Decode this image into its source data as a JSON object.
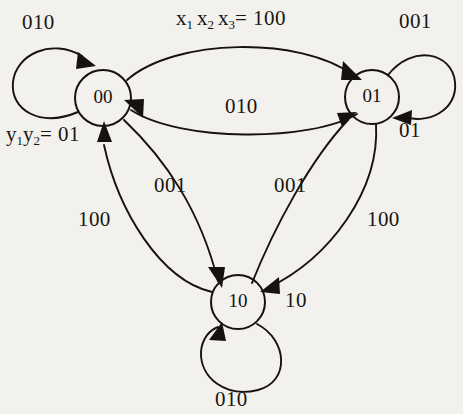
{
  "diagram": {
    "ink_color": "#15120f",
    "background_color": "#f2f1ee",
    "states": [
      {
        "id": "s00",
        "label": "00",
        "cx": 103,
        "cy": 98,
        "r": 28
      },
      {
        "id": "s01",
        "label": "01",
        "cx": 372,
        "cy": 97,
        "r": 27
      },
      {
        "id": "s10",
        "label": "10",
        "cx": 238,
        "cy": 302,
        "r": 27
      }
    ],
    "legend": {
      "input_vars_prefix": "x",
      "input_label_parts": {
        "x1": "x",
        "sub1": "1",
        "x2": "x",
        "sub2": "2",
        "x3": "x",
        "sub3": "3",
        "equals": "= 100"
      },
      "state_vars_parts": {
        "y1": "y",
        "sub1": "1",
        "y2": "y",
        "sub2": "2",
        "equals": "= 01"
      },
      "input_label_text": "x1 x2 x3 = 100",
      "state_label_text": "y1y2= 01"
    },
    "transitions": [
      {
        "id": "t-00-00",
        "from": "00",
        "to": "00",
        "input": "010",
        "kind": "self-loop-left"
      },
      {
        "id": "t-00-01",
        "from": "00",
        "to": "01",
        "input": "100",
        "kind": "arc-top"
      },
      {
        "id": "t-01-00",
        "from": "01",
        "to": "00",
        "input": "010",
        "kind": "arc-middle"
      },
      {
        "id": "t-01-01",
        "from": "01",
        "to": "01",
        "input": "001",
        "kind": "self-loop-right"
      },
      {
        "id": "t-01-01-out",
        "from": "01",
        "to": "01",
        "input": "01",
        "kind": "self-loop-right-output"
      },
      {
        "id": "t-00-10",
        "from": "00",
        "to": "10",
        "input": "001",
        "kind": "arc-left-down"
      },
      {
        "id": "t-10-00",
        "from": "10",
        "to": "00",
        "input": "100",
        "kind": "arc-left-up"
      },
      {
        "id": "t-10-01",
        "from": "10",
        "to": "01",
        "input": "001",
        "kind": "arc-right-up"
      },
      {
        "id": "t-01-10",
        "from": "01",
        "to": "10",
        "input": "100",
        "kind": "arc-right-down"
      },
      {
        "id": "t-10-10",
        "from": "10",
        "to": "10",
        "input": "010",
        "kind": "self-loop-bottom"
      },
      {
        "id": "t-10-out",
        "from": "10",
        "to": "10",
        "input": "10",
        "kind": "output-label"
      }
    ],
    "labels": {
      "loop_00_010": "010",
      "top_input_equation": "x1 x2 x3 = 100",
      "loop_01_001": "001",
      "mid_010": "010",
      "state_vars": "y1y2= 01",
      "loop_01_01": "01",
      "left_001": "001",
      "right_001": "001",
      "left_100": "100",
      "right_100": "100",
      "node10_right_10": "10",
      "loop_10_010": "010"
    }
  }
}
